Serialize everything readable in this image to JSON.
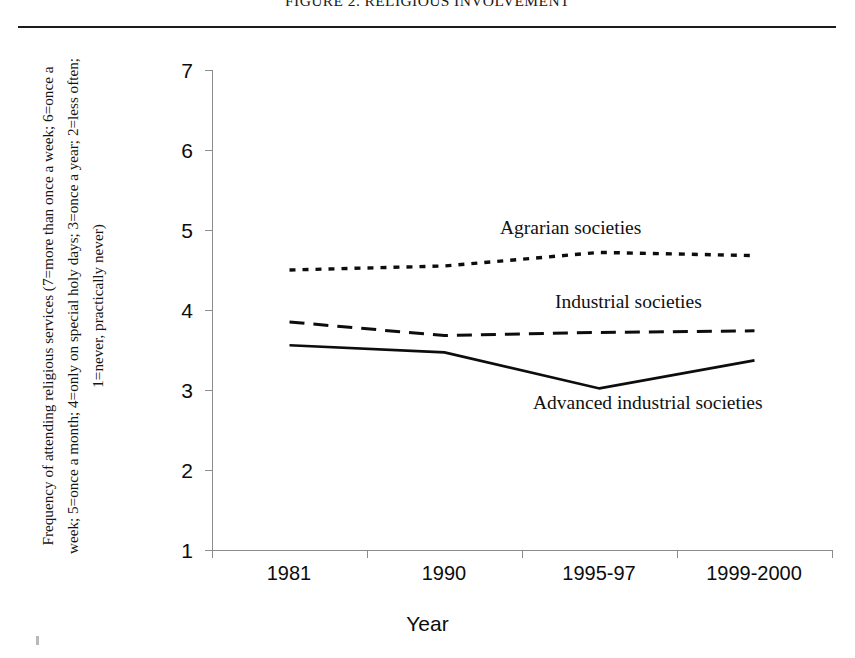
{
  "figure": {
    "title": "FIGURE 2. RELIGIOUS INVOLVEMENT"
  },
  "axes": {
    "y_caption": "Frequency of attending religious services (7=more than once a week; 6=once a week; 5=once a month; 4=only on special holy days; 3=once a year; 2=less often; 1=never, practically never)",
    "x_title": "Year",
    "y_ticks": [
      "7",
      "6",
      "5",
      "4",
      "3",
      "2",
      "1"
    ],
    "x_ticks": [
      "1981",
      "1990",
      "1995-97",
      "1999-2000"
    ]
  },
  "annotations": {
    "agrarian": "Agrarian societies",
    "industrial": "Industrial societies",
    "advanced": "Advanced industrial societies"
  },
  "chart_data": {
    "type": "line",
    "title": "FIGURE 2. RELIGIOUS INVOLVEMENT",
    "xlabel": "Year",
    "ylabel": "Frequency of attending religious services (7=more than once a week; 6=once a week; 5=once a month; 4=only on special holy days; 3=once a year; 2=less often; 1=never, practically never)",
    "categories": [
      "1981",
      "1990",
      "1995-97",
      "1999-2000"
    ],
    "ylim": [
      1,
      7
    ],
    "ytick_values": [
      1,
      2,
      3,
      4,
      5,
      6,
      7
    ],
    "grid": false,
    "legend_position": "inline-annotations",
    "series": [
      {
        "name": "Agrarian societies",
        "style": "dotted",
        "color": "#0d0d0d",
        "values": [
          4.5,
          4.55,
          4.72,
          4.68
        ]
      },
      {
        "name": "Industrial societies",
        "style": "dashed",
        "color": "#0d0d0d",
        "values": [
          3.85,
          3.68,
          3.72,
          3.74
        ]
      },
      {
        "name": "Advanced industrial societies",
        "style": "solid",
        "color": "#0d0d0d",
        "values": [
          3.56,
          3.47,
          3.02,
          3.37
        ]
      }
    ]
  }
}
